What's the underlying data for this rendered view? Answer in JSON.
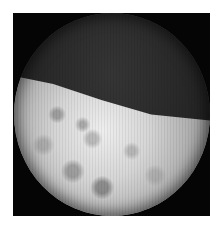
{
  "image": {
    "description": "Grayscale circular field-of-view photograph (endoscopic/microscopic style) within a black square frame on white background",
    "regions": [
      {
        "name": "dark-upper-region",
        "tone": "dark gray"
      },
      {
        "name": "bright-lower-region",
        "tone": "light gray, mottled texture"
      }
    ],
    "colors": {
      "background": "#ffffff",
      "frame": "#050505",
      "dark_region": "#262626",
      "bright_region": "#d6d6d6"
    }
  }
}
